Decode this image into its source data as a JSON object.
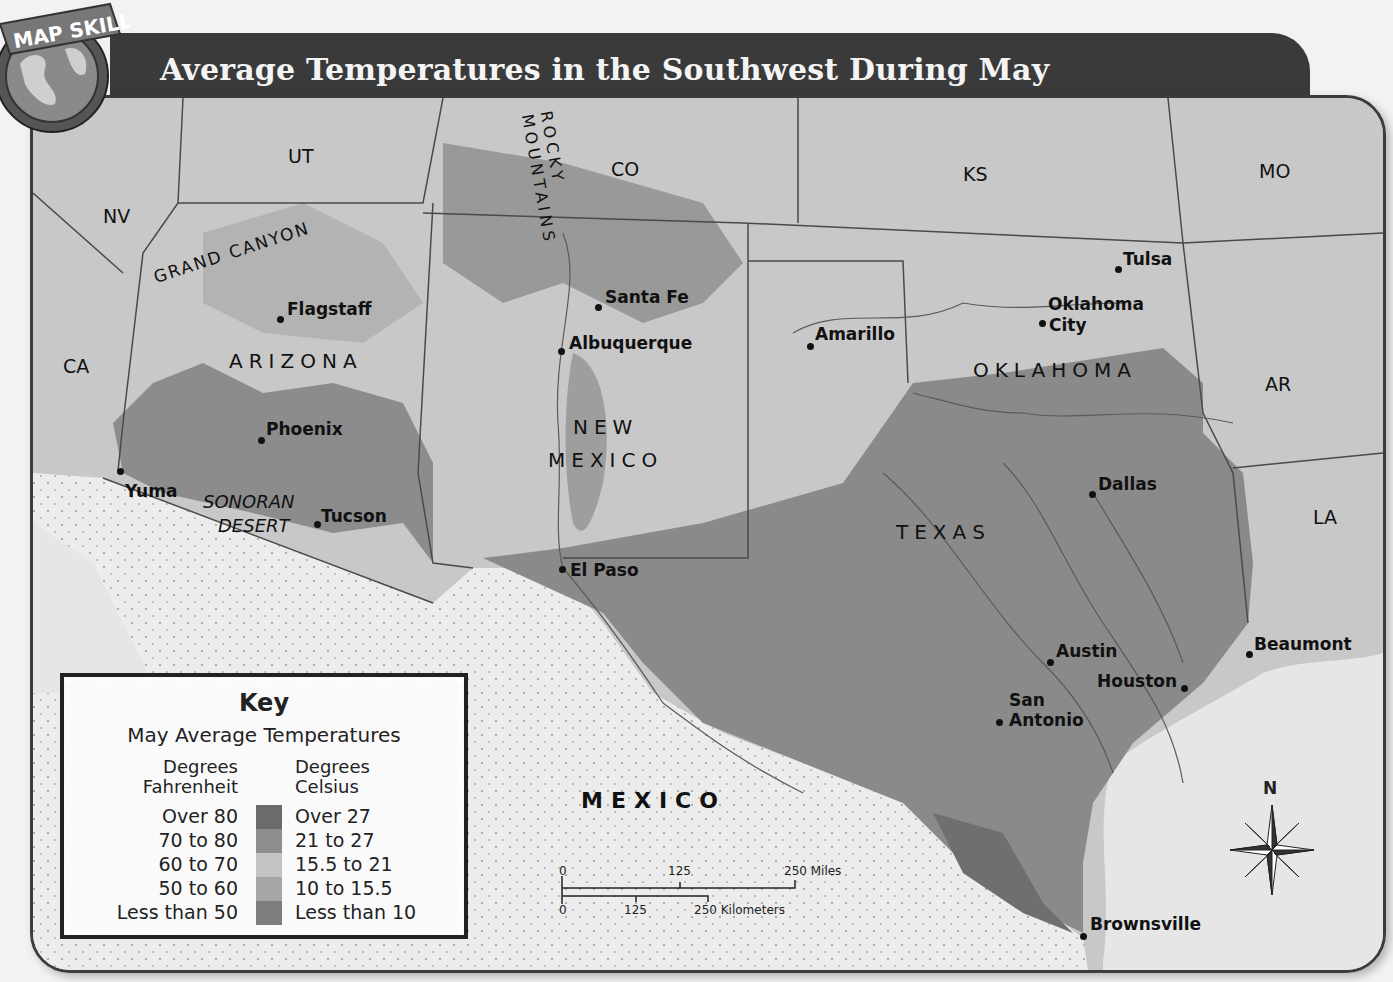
{
  "header": {
    "badge_label": "MAP SKILL",
    "title": "Average Temperatures in the Southwest During May"
  },
  "map": {
    "states": [
      {
        "label": "UT",
        "x": 285,
        "y": 142
      },
      {
        "label": "NV",
        "x": 100,
        "y": 202
      },
      {
        "label": "CO",
        "x": 608,
        "y": 155
      },
      {
        "label": "KS",
        "x": 960,
        "y": 160
      },
      {
        "label": "MO",
        "x": 1256,
        "y": 157
      },
      {
        "label": "CA",
        "x": 60,
        "y": 352
      },
      {
        "label": "AR",
        "x": 1262,
        "y": 370
      },
      {
        "label": "LA",
        "x": 1310,
        "y": 503
      }
    ],
    "regions": [
      {
        "label": "ARIZONA",
        "x": 226,
        "y": 346
      },
      {
        "label": "NEW",
        "x": 570,
        "y": 412
      },
      {
        "label": "MEXICO",
        "x": 545,
        "y": 445
      },
      {
        "label": "OKLAHOMA",
        "x": 970,
        "y": 355
      },
      {
        "label": "TEXAS",
        "x": 893,
        "y": 517
      },
      {
        "label": "MEXICO",
        "x": 578,
        "y": 785
      }
    ],
    "features": [
      {
        "label": "GRAND CANYON",
        "x": 148,
        "y": 262
      },
      {
        "label": "ROCKY MOUNTAINS",
        "x": 480,
        "y": 118
      },
      {
        "label": "SONORAN",
        "x": 200,
        "y": 488
      },
      {
        "label": "DESERT",
        "x": 215,
        "y": 512
      }
    ],
    "cities": [
      {
        "name": "Flagstaff",
        "dot": [
          277,
          316
        ],
        "x": 284,
        "y": 296
      },
      {
        "name": "Phoenix",
        "dot": [
          258,
          437
        ],
        "x": 263,
        "y": 416
      },
      {
        "name": "Yuma",
        "dot": [
          117,
          468
        ],
        "x": 122,
        "y": 478
      },
      {
        "name": "Tucson",
        "dot": [
          314,
          521
        ],
        "x": 318,
        "y": 503
      },
      {
        "name": "Santa Fe",
        "dot": [
          595,
          304
        ],
        "x": 602,
        "y": 284
      },
      {
        "name": "Albuquerque",
        "dot": [
          558,
          348
        ],
        "x": 566,
        "y": 330
      },
      {
        "name": "El Paso",
        "dot": [
          559,
          566
        ],
        "x": 567,
        "y": 557
      },
      {
        "name": "Amarillo",
        "dot": [
          807,
          343
        ],
        "x": 812,
        "y": 321
      },
      {
        "name": "Tulsa",
        "dot": [
          1115,
          266
        ],
        "x": 1120,
        "y": 246
      },
      {
        "name": "Oklahoma",
        "dot": null,
        "x": 1045,
        "y": 291
      },
      {
        "name": "City",
        "dot": [
          1039,
          320
        ],
        "x": 1046,
        "y": 312
      },
      {
        "name": "Dallas",
        "dot": [
          1089,
          491
        ],
        "x": 1095,
        "y": 471
      },
      {
        "name": "Austin",
        "dot": [
          1047,
          659
        ],
        "x": 1053,
        "y": 638
      },
      {
        "name": "Beaumont",
        "dot": [
          1246,
          651
        ],
        "x": 1251,
        "y": 631
      },
      {
        "name": "Houston",
        "dot": [
          1181,
          685
        ],
        "x": 1094,
        "y": 668
      },
      {
        "name": "San",
        "dot": null,
        "x": 1006,
        "y": 687
      },
      {
        "name": "Antonio",
        "dot": [
          996,
          719
        ],
        "x": 1006,
        "y": 707
      },
      {
        "name": "Brownsville",
        "dot": [
          1080,
          933
        ],
        "x": 1087,
        "y": 911
      }
    ]
  },
  "legend": {
    "title": "Key",
    "subtitle": "May Average Temperatures",
    "fahrenheit_header": [
      "Degrees",
      "Fahrenheit"
    ],
    "celsius_header": [
      "Degrees",
      "Celsius"
    ],
    "rows": [
      {
        "f": "Over 80",
        "c": "Over 27",
        "color": "#6b6b6b"
      },
      {
        "f": "70 to 80",
        "c": "21 to 27",
        "color": "#8e8e8e"
      },
      {
        "f": "60 to 70",
        "c": "15.5 to 21",
        "color": "#c4c4c4"
      },
      {
        "f": "50 to 60",
        "c": "10 to 15.5",
        "color": "#a6a6a6"
      },
      {
        "f": "Less than 50",
        "c": "Less than 10",
        "color": "#7d7d7d"
      }
    ]
  },
  "scale": {
    "miles": {
      "start": "0",
      "mid": "125",
      "end": "250 Miles"
    },
    "km": {
      "start": "0",
      "mid": "125",
      "end": "250 Kilometers"
    }
  },
  "compass": {
    "north_label": "N"
  }
}
